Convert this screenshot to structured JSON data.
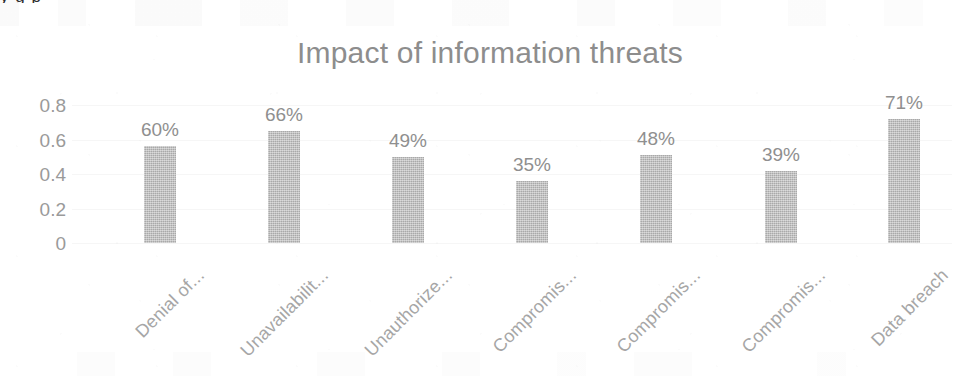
{
  "chart_data": {
    "type": "bar",
    "title": "Impact of information threats",
    "xlabel": "",
    "ylabel": "",
    "categories": [
      "Denial of...",
      "Unavailabilit...",
      "Unauthorize...",
      "Compromis...",
      "Compromis...",
      "Compromis...",
      "Data breach"
    ],
    "values": [
      0.565,
      0.65,
      0.5,
      0.36,
      0.51,
      0.42,
      0.72
    ],
    "data_labels": [
      "60%",
      "66%",
      "49%",
      "35%",
      "48%",
      "39%",
      "71%"
    ],
    "ytick_labels": [
      "0.8",
      "0.6",
      "0.4",
      "0.2",
      "0"
    ],
    "ytick_values": [
      0.8,
      0.6,
      0.4,
      0.2,
      0
    ],
    "ylim": [
      0,
      0.8
    ],
    "grid": true,
    "legend": "none",
    "bar_color": "#bcbcbc",
    "title_color": "#8d8d8d",
    "label_color": "#8f8f8f",
    "tick_color": "#9a9a9a",
    "background_color": "#ffffff"
  },
  "artifacts": {
    "top_stub_text": "y g   p"
  }
}
